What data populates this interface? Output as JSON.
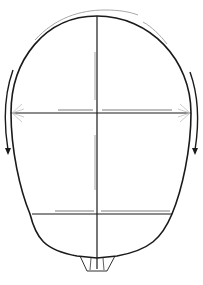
{
  "diagram": {
    "colors": {
      "outline": "#1a1a1a",
      "guide": "#a8a8a8",
      "background": "#ffffff"
    },
    "elements": [
      "head-outline",
      "vertical-center-line",
      "upper-horizontal-line",
      "lower-horizontal-line",
      "top-arc-guides",
      "left-rotation-arrow",
      "right-rotation-arrow",
      "nose-tip-shape"
    ]
  }
}
